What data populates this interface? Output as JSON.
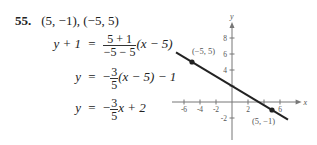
{
  "problem": {
    "number": "55.",
    "points": "(5, −1), (−5, 5)"
  },
  "steps": [
    {
      "lhs": "y + 1",
      "eq": "=",
      "sign": "",
      "frac_num": "5 + 1",
      "frac_den": "−5 − 5",
      "rest": "(x − 5)"
    },
    {
      "lhs": "y",
      "eq": "=",
      "sign": "−",
      "frac_num": "3",
      "frac_den": "5",
      "rest": "(x − 5) − 1"
    },
    {
      "lhs": "y",
      "eq": "=",
      "sign": "−",
      "frac_num": "3",
      "frac_den": "5",
      "rest": "x + 2"
    }
  ],
  "chart_data": {
    "type": "line",
    "title": "",
    "xlabel": "x",
    "ylabel": "y",
    "xlim": [
      -7.5,
      8.2
    ],
    "ylim": [
      -3.5,
      9.5
    ],
    "x_ticks": [
      -6,
      -4,
      -2,
      2,
      4,
      6
    ],
    "x_tick_labels": [
      "-6",
      "-4",
      "-2",
      "2",
      "",
      "6"
    ],
    "y_ticks": [
      -2,
      2,
      4,
      6,
      8
    ],
    "y_tick_labels": [
      "-2",
      "",
      "4",
      "6",
      "8"
    ],
    "grid": false,
    "line": {
      "slope": -0.6,
      "intercept": 2,
      "x_range": [
        -7,
        7
      ]
    },
    "points": [
      {
        "x": -5,
        "y": 5,
        "label": "(−5, 5)"
      },
      {
        "x": 5,
        "y": -1,
        "label": "(5, −1)"
      }
    ],
    "line_color": "#222222",
    "axis_color": "#777777"
  }
}
